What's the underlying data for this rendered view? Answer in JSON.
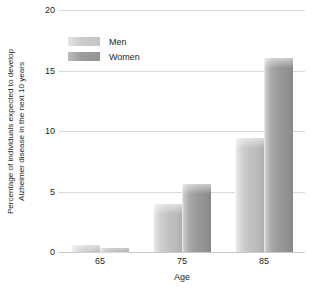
{
  "chart_data": {
    "type": "bar",
    "title": "",
    "xlabel": "Age",
    "ylabel_line1": "Percentage of individuals expected to develop",
    "ylabel_line2": "Alzheimer disease in the next 10 years",
    "categories": [
      "65",
      "75",
      "85"
    ],
    "series": [
      {
        "name": "Men",
        "values": [
          0.6,
          4.0,
          9.4
        ],
        "color": "#c4c4c4"
      },
      {
        "name": "Women",
        "values": [
          0.3,
          5.6,
          16.0
        ],
        "color": "#949494"
      }
    ],
    "ylim": [
      0,
      20
    ],
    "yticks": [
      "0",
      "5",
      "10",
      "15",
      "20"
    ],
    "ytick_values": [
      0,
      5,
      10,
      15,
      20
    ],
    "grid": true,
    "legend_position": "top-left-inside"
  }
}
